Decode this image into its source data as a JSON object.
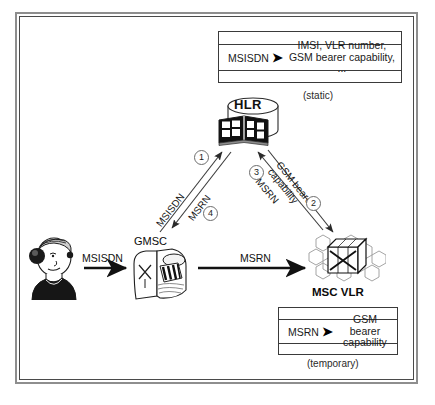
{
  "figure": {
    "border_color": "#8e8e8e"
  },
  "hlr": {
    "label": "HLR",
    "icon": "database-book-icon"
  },
  "gmsc": {
    "label": "GMSC",
    "icon": "switch-icon"
  },
  "msc_vlr": {
    "label": "MSC VLR",
    "icon": "switch-cell-icon"
  },
  "caller": {
    "icon": "person-on-phone-icon"
  },
  "hlr_table": {
    "key": "MSISDN",
    "arrow": "➤",
    "value_line1": "IMSI, VLR number,",
    "value_line2": "GSM bearer capability, ...",
    "caption": "(static)"
  },
  "vlr_table": {
    "key": "MSRN",
    "arrow": "➤",
    "value_line1": "GSM bearer",
    "value_line2": "capability",
    "caption": "(temporary)"
  },
  "flows": {
    "caller_to_gmsc": "MSISDN",
    "gmsc_to_msc": "MSRN",
    "step1_label": "MSISDN",
    "step1_number": "1",
    "step2_label_line1": "GSM bearer",
    "step2_label_line2": "capability",
    "step2_number": "2",
    "step3_label": "MSRN",
    "step3_number": "3",
    "step4_label": "MSRN",
    "step4_number": "4"
  }
}
